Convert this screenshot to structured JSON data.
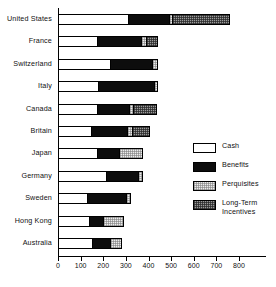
{
  "chart_data": {
    "type": "bar",
    "orientation": "horizontal",
    "stacked": true,
    "title": "",
    "xlabel": "",
    "ylabel": "",
    "xlim": [
      0,
      800
    ],
    "xticks": [
      0,
      100,
      200,
      300,
      400,
      500,
      600,
      700,
      800
    ],
    "xtick_labels": [
      "0",
      "100",
      "200",
      "300",
      "400",
      "500",
      "600",
      "700",
      "800"
    ],
    "grid": false,
    "legend_position": "right",
    "categories": [
      "United  States",
      "France",
      "Switzerland",
      "Italy",
      "Canada",
      "Britain",
      "Japan",
      "Germany",
      "Sweden",
      "Hong  Kong",
      "Australia"
    ],
    "series": [
      {
        "name": "Cash",
        "fill": "white",
        "values": [
          313,
          176,
          233,
          181,
          176,
          150,
          176,
          216,
          132,
          141,
          154
        ]
      },
      {
        "name": "Benefits",
        "fill": "black",
        "values": [
          181,
          194,
          189,
          247,
          141,
          159,
          97,
          141,
          172,
          62,
          79
        ]
      },
      {
        "name": "Perquisites",
        "fill": "light-dotted",
        "values": [
          13,
          22,
          18,
          13,
          18,
          22,
          101,
          18,
          18,
          88,
          48
        ]
      },
      {
        "name": "Long-Term Incentives",
        "fill": "dark-dotted",
        "values": [
          255,
          48,
          0,
          0,
          101,
          75,
          0,
          0,
          0,
          0,
          0
        ]
      }
    ],
    "totals": [
      762,
      440,
      440,
      441,
      436,
      406,
      374,
      375,
      322,
      291,
      281
    ]
  },
  "legend": {
    "items": [
      {
        "label": "Cash",
        "swatch": "cash-swatch"
      },
      {
        "label": "Benefits",
        "swatch": "benefits-swatch"
      },
      {
        "label": "Perquisites",
        "swatch": "perquisites-swatch"
      },
      {
        "label": "Long-Term\nIncentives",
        "swatch": "long-term-incentives-swatch"
      }
    ]
  }
}
